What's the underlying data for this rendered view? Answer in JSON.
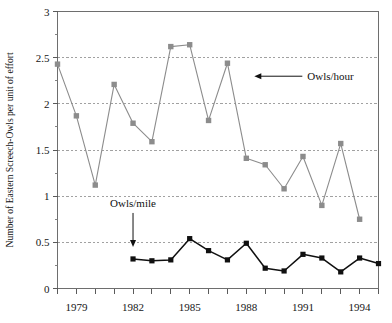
{
  "chart_data": {
    "type": "line",
    "title": "",
    "xlabel": "",
    "ylabel": "Number of Eastern Screech-Owls per unit of effort",
    "xlim": [
      1978,
      1995
    ],
    "ylim": [
      0,
      3
    ],
    "grid": true,
    "grid_axis": "y",
    "legend": "none",
    "y_ticks_major": [
      "0",
      "0.5",
      "1",
      "1.5",
      "2",
      "2.5",
      "3"
    ],
    "y_tick_values": [
      0,
      0.5,
      1,
      1.5,
      2,
      2.5,
      3
    ],
    "y_minor_step": 0.25,
    "x_ticks_labeled": [
      "1979",
      "1982",
      "1985",
      "1988",
      "1991",
      "1994"
    ],
    "x_tick_values": [
      1978,
      1979,
      1980,
      1981,
      1982,
      1983,
      1984,
      1985,
      1986,
      1987,
      1988,
      1989,
      1990,
      1991,
      1992,
      1993,
      1994,
      1995
    ],
    "x": [
      1978,
      1979,
      1980,
      1981,
      1982,
      1983,
      1984,
      1985,
      1986,
      1987,
      1988,
      1989,
      1990,
      1991,
      1992,
      1993,
      1994,
      1995
    ],
    "series": [
      {
        "name": "Owls/hour",
        "color": "#8c8c8c",
        "marker": "square",
        "x": [
          1978,
          1979,
          1980,
          1981,
          1982,
          1983,
          1984,
          1985,
          1986,
          1987,
          1988,
          1989,
          1990,
          1991,
          1992,
          1993,
          1994,
          1995
        ],
        "values": [
          2.43,
          1.87,
          1.12,
          2.21,
          1.79,
          1.59,
          2.62,
          2.64,
          1.82,
          2.44,
          1.41,
          1.34,
          1.08,
          1.43,
          0.9,
          1.57,
          0.75,
          null
        ]
      },
      {
        "name": "Owls/mile",
        "color": "#101010",
        "marker": "square",
        "x": [
          1982,
          1983,
          1984,
          1985,
          1986,
          1987,
          1988,
          1989,
          1990,
          1991,
          1992,
          1993,
          1994,
          1995
        ],
        "values": [
          0.32,
          0.3,
          0.31,
          0.54,
          0.41,
          0.31,
          0.49,
          0.22,
          0.19,
          0.37,
          0.33,
          0.18,
          0.33,
          0.27
        ]
      }
    ],
    "annotations": [
      {
        "text": "Owls/hour",
        "arrow": "left",
        "points_to_year": 1988,
        "points_to_value": 2.44
      },
      {
        "text": "Owls/mile",
        "arrow": "down",
        "points_to_year": 1982,
        "points_to_value": 0.32
      }
    ]
  }
}
